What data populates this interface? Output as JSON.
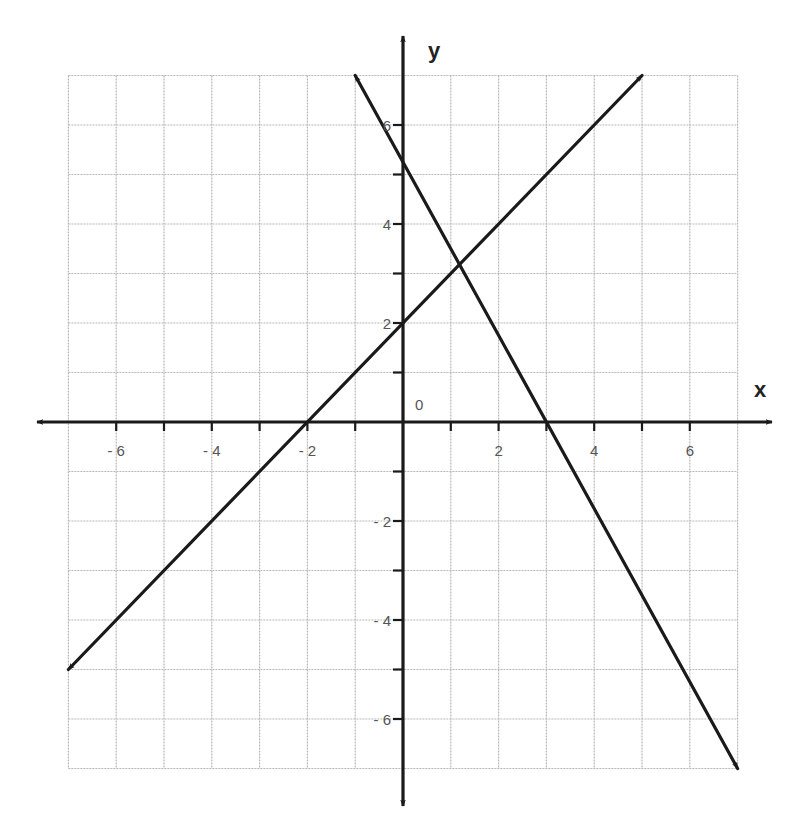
{
  "chart_data": {
    "type": "line",
    "title": "",
    "xlabel": "x",
    "ylabel": "y",
    "xlim": [
      -7,
      7
    ],
    "ylim": [
      -7,
      7
    ],
    "grid": true,
    "grid_step": 1,
    "origin_label": "0",
    "x_ticks": [
      {
        "value": -6,
        "label": "- 6"
      },
      {
        "value": -4,
        "label": "- 4"
      },
      {
        "value": -2,
        "label": "- 2"
      },
      {
        "value": 2,
        "label": "2"
      },
      {
        "value": 4,
        "label": "4"
      },
      {
        "value": 6,
        "label": "6"
      }
    ],
    "y_ticks": [
      {
        "value": 6,
        "label": "6"
      },
      {
        "value": 4,
        "label": "4"
      },
      {
        "value": 2,
        "label": "2"
      },
      {
        "value": -2,
        "label": "- 2"
      },
      {
        "value": -4,
        "label": "- 4"
      },
      {
        "value": -6,
        "label": "- 6"
      }
    ],
    "series": [
      {
        "name": "line-1",
        "equation": "y = x + 2",
        "slope": 1,
        "intercept": 2,
        "x_intercept": -2,
        "endpoints": [
          [
            -7,
            -5
          ],
          [
            5,
            7
          ]
        ],
        "arrows": "both"
      },
      {
        "name": "line-2",
        "equation": "y = -1.75x + 5.25",
        "slope": -1.75,
        "intercept": 5.25,
        "x_intercept": 3,
        "endpoints": [
          [
            -1,
            7
          ],
          [
            7,
            -7
          ]
        ],
        "arrows": "both"
      }
    ],
    "intersection": [
      1.18,
      3.18
    ],
    "legend": null
  },
  "colors": {
    "grid": "#b8b8b8",
    "axis": "#1a1a1a",
    "line": "#1a1a1a",
    "label": "#555555"
  }
}
